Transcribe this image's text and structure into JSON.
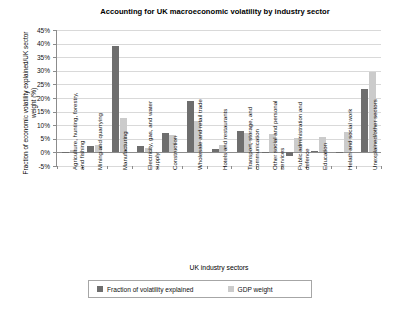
{
  "chart_data": {
    "type": "bar",
    "title": "Accounting for UK macroeconomic volatility by industry sector",
    "xlabel": "UK industry sectors",
    "ylabel": "Fraction of economic volatility explained/UK sector weight (%)",
    "ylim": [
      -5,
      45
    ],
    "ytick_labels": [
      "45%",
      "40%",
      "35%",
      "30%",
      "25%",
      "20%",
      "15%",
      "10%",
      "5%",
      "0%",
      "-5%"
    ],
    "ytick_values": [
      45,
      40,
      35,
      30,
      25,
      20,
      15,
      10,
      5,
      0,
      -5
    ],
    "grid": true,
    "legend_position": "bottom",
    "categories": [
      "Agriculture, hunting, forestry, and fishing",
      "Mining and quarrying",
      "Manufacturing",
      "Electricity, gas, and water supply",
      "Construction",
      "Wholesale and retail trade",
      "Hotels and restaurants",
      "Transport, storage, and communication",
      "Other social and personal services",
      "Public administration and defence",
      "Education",
      "Helath and social work",
      "Unexplained/other sectors"
    ],
    "series": [
      {
        "name": "Fraction of volatility explained",
        "color": "#6e6e6e",
        "values": [
          0.3,
          2.3,
          39.0,
          2.5,
          7.3,
          18.9,
          1.2,
          7.9,
          0.2,
          -1.3,
          0.6,
          0.3,
          23.2
        ]
      },
      {
        "name": "GDP weight",
        "color": "#cbcbcb",
        "values": [
          0.9,
          2.6,
          12.8,
          1.6,
          6.3,
          11.4,
          2.8,
          7.2,
          6.8,
          5.2,
          5.8,
          7.4,
          29.5
        ]
      }
    ]
  },
  "legend": {
    "items": [
      {
        "label": "Fraction of volatility explained"
      },
      {
        "label": "GDP weight"
      }
    ]
  }
}
